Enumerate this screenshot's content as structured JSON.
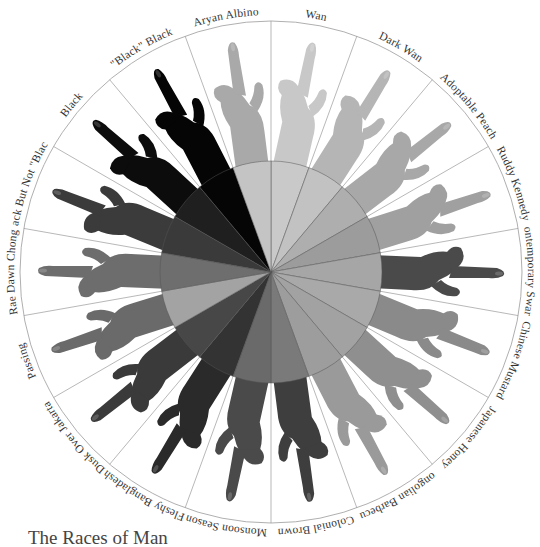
{
  "title": "The Races of Man",
  "chart_data": {
    "type": "pie",
    "title": "The Races of Man",
    "start_angle_deg": 0,
    "direction": "clockwise",
    "categories": [
      "Wan",
      "Dark Wan",
      "Adoptable Peach",
      "Ruddy Kennedy",
      "Contemporary Swarth",
      "Chinese Mustard",
      "Japanese Honey",
      "Mongolian Barbecue",
      "Colonial Brown",
      "Monsoon Season",
      "Fleshy Bangladeshi",
      "Dusk Over Jakarta",
      "Passing",
      "Rae Dawn Chong",
      "Black But Not \"Black\"",
      "Black",
      "\"Black\" Black",
      "Aryan Albino"
    ],
    "values": [
      1,
      1,
      1,
      1,
      1,
      1,
      1,
      1,
      1,
      1,
      1,
      1,
      1,
      1,
      1,
      1,
      1,
      1
    ],
    "colors": [
      "#c9c9c9",
      "#c2c2c2",
      "#aeaeae",
      "#9c9c9c",
      "#a6a6a6",
      "#a9a9a9",
      "#a2a2a2",
      "#9d9d9d",
      "#7a7a7a",
      "#6a6a6a",
      "#333333",
      "#474747",
      "#a3a3a3",
      "#6e6e6e",
      "#3a3a3a",
      "#1f1f1f",
      "#050505",
      "#c4c4c4"
    ],
    "hand_colors": [
      "#c8c8c8",
      "#b5b5b5",
      "#a8a8a8",
      "#a0a0a0",
      "#4a4a4a",
      "#8a8a8a",
      "#8f8f8f",
      "#9a9a9a",
      "#3e3e3e",
      "#4a4a4a",
      "#2a2a2a",
      "#3a3a3a",
      "#6a6a6a",
      "#6d6d6d",
      "#3b3b3b",
      "#0c0c0c",
      "#050505",
      "#a9a9a9"
    ],
    "legend_position": "labels around outer ring"
  }
}
